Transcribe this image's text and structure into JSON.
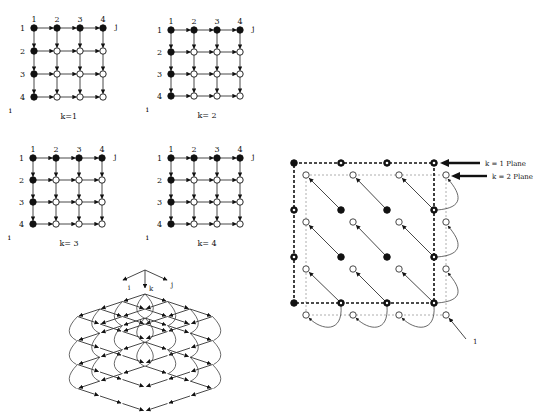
{
  "grids": [
    {
      "caption": "k=1",
      "col_labels": [
        "1",
        "2",
        "3",
        "4"
      ],
      "row_labels": [
        "1",
        "2",
        "3",
        "4"
      ],
      "axis_i": "i",
      "axis_j": "j",
      "origin": [
        34,
        28
      ],
      "dx": 23,
      "dy": 23
    },
    {
      "caption": "k= 2",
      "col_labels": [
        "1",
        "2",
        "3",
        "4"
      ],
      "row_labels": [
        "1",
        "2",
        "3",
        "4"
      ],
      "axis_i": "i",
      "axis_j": "j",
      "origin": [
        171,
        30
      ],
      "dx": 23,
      "dy": 22
    },
    {
      "caption": "k= 3",
      "col_labels": [
        "1",
        "2",
        "3",
        "4"
      ],
      "row_labels": [
        "1",
        "2",
        "3",
        "4"
      ],
      "axis_i": "i",
      "axis_j": "j",
      "origin": [
        33,
        158
      ],
      "dx": 23,
      "dy": 22
    },
    {
      "caption": "k= 4",
      "col_labels": [
        "1",
        "2",
        "3",
        "4"
      ],
      "row_labels": [
        "1",
        "2",
        "3",
        "4"
      ],
      "axis_i": "i",
      "axis_j": "j",
      "origin": [
        171,
        158
      ],
      "dx": 23,
      "dy": 22
    }
  ],
  "isometric": {
    "axis_labels": {
      "i": "i",
      "k": "k",
      "j": "j"
    }
  },
  "plane_diagram": {
    "labels": {
      "k1": "k = 1 Plane",
      "k2": "k = 2 Plane",
      "one": "1"
    }
  }
}
